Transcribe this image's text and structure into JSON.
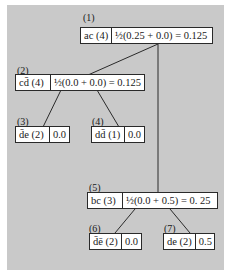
{
  "diagram": {
    "type": "tree",
    "nodes": [
      {
        "id": "1",
        "label": "(1)",
        "itemset": "ac (4)",
        "value": "½(0.25 + 0.0) = 0.125"
      },
      {
        "id": "2",
        "label": "(2)",
        "itemset": "cd̄ (4)",
        "value": "½(0.0 + 0.0) = 0.125"
      },
      {
        "id": "3",
        "label": "(3)",
        "itemset": "d̄e (2)",
        "value": "0.0"
      },
      {
        "id": "4",
        "label": "(4)",
        "itemset": "dd̄ (1)",
        "value": "0.0"
      },
      {
        "id": "5",
        "label": "(5)",
        "itemset": "bc (3)",
        "value": "½(0.0 + 0.5) = 0. 25"
      },
      {
        "id": "6",
        "label": "(6)",
        "itemset": "d̄ē (2)",
        "value": "0.0"
      },
      {
        "id": "7",
        "label": "(7)",
        "itemset": "de (2)",
        "value": "0.5"
      }
    ],
    "edges": [
      {
        "from": "1",
        "to": "2"
      },
      {
        "from": "1",
        "to": "5"
      },
      {
        "from": "2",
        "to": "3"
      },
      {
        "from": "2",
        "to": "4"
      },
      {
        "from": "5",
        "to": "6"
      },
      {
        "from": "5",
        "to": "7"
      }
    ],
    "colors": {
      "background": "#c9c9c9",
      "box": "#ffffff",
      "line": "#2a2a2a"
    }
  }
}
